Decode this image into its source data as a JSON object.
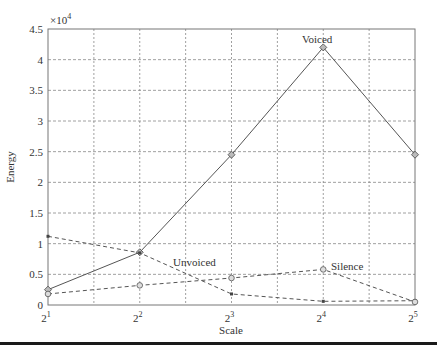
{
  "chart_data": {
    "type": "line",
    "title": "",
    "xlabel": "Scale",
    "ylabel": "Energy",
    "y_multiplier_label": "×10",
    "y_multiplier_exp": "4",
    "x_base": "2",
    "x_exponents": [
      "1",
      "2",
      "3",
      "4",
      "5"
    ],
    "categories": [
      "2^1",
      "2^2",
      "2^3",
      "2^4",
      "2^5"
    ],
    "ylim": [
      0,
      4.5
    ],
    "yticks": [
      "0",
      "0.5",
      "1",
      "1.5",
      "2",
      "2.5",
      "3",
      "3.5",
      "4",
      "4.5"
    ],
    "grid": true,
    "series": [
      {
        "name": "Voiced",
        "style": "solid",
        "marker": "diamond",
        "values": [
          0.25,
          0.86,
          2.45,
          4.2,
          2.45
        ]
      },
      {
        "name": "Unvoiced",
        "style": "dashed",
        "marker": "star",
        "values": [
          1.12,
          0.85,
          0.18,
          0.06,
          0.07
        ]
      },
      {
        "name": "Silence",
        "style": "dashed",
        "marker": "circle-triangle",
        "values": [
          0.18,
          0.32,
          0.44,
          0.58,
          0.05
        ]
      }
    ],
    "annotations": [
      {
        "text": "Voiced",
        "at": "2^4"
      },
      {
        "text": "Unvoiced",
        "at": "between 2^2 and 2^3"
      },
      {
        "text": "Silence",
        "at": "2^4"
      }
    ]
  }
}
